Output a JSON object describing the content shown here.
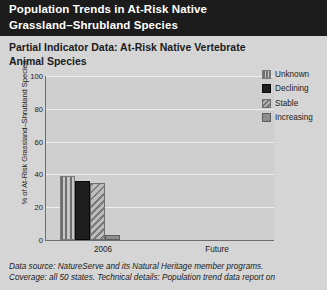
{
  "header": {
    "title_lines": [
      "Population Trends in At-Risk Native",
      "Grassland–Shrubland Species"
    ],
    "band_color": "#1c1c1c",
    "text_color": "#ffffff"
  },
  "subtitle_lines": [
    "Partial Indicator Data: At-Risk Native Vertebrate",
    "Animal Species"
  ],
  "footnote_lines": [
    "Data source: NatureServe and its Natural Heritage member programs.",
    "Coverage: all 50 states. Technical details: Population trend data report on"
  ],
  "legend": {
    "items": [
      {
        "label": "Unknown",
        "swatch": "vertical-stripe-swatch",
        "color": "#b3b3b3"
      },
      {
        "label": "Declining",
        "swatch": "solid-dark-swatch",
        "color": "#1e1e1e"
      },
      {
        "label": "Stable",
        "swatch": "diagonal-hatch-swatch",
        "color": "#9e9e9e"
      },
      {
        "label": "Increasing",
        "swatch": "solid-gray-swatch",
        "color": "#8c8c8c"
      }
    ]
  },
  "chart_data": {
    "type": "bar",
    "title": "Partial Indicator Data: At-Risk Native Vertebrate Animal Species",
    "xlabel": "",
    "ylabel": "% of At-Risk Grassland–Shrubland Species",
    "categories": [
      "2006",
      "Future"
    ],
    "series": [
      {
        "name": "Unknown",
        "values": [
          39,
          null
        ]
      },
      {
        "name": "Declining",
        "values": [
          36,
          null
        ]
      },
      {
        "name": "Stable",
        "values": [
          35,
          null
        ]
      },
      {
        "name": "Increasing",
        "values": [
          3,
          null
        ]
      }
    ],
    "ylim": [
      0,
      100
    ],
    "yticks": [
      0,
      20,
      40,
      60,
      80,
      100
    ],
    "ytick_labels": [
      "0",
      "20",
      "40",
      "60",
      "80",
      "100"
    ],
    "grid": true,
    "legend_position": "top-right",
    "plot_background": "#cfcfcf",
    "gridline_color": "#eeeeee",
    "axis_color": "#6d6d6d"
  }
}
